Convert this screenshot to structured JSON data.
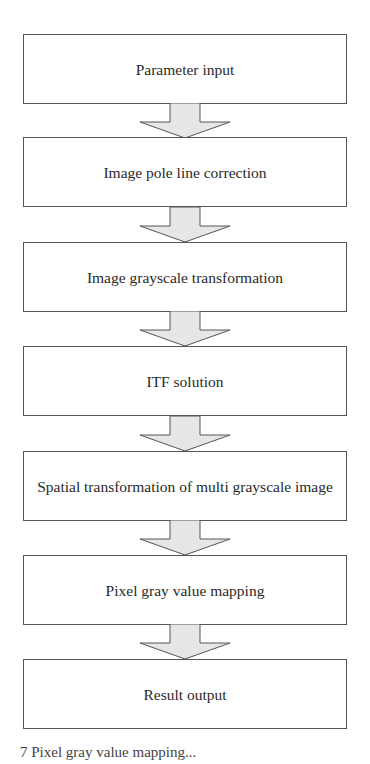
{
  "diagram": {
    "type": "flowchart",
    "direction": "top-to-bottom",
    "steps": [
      {
        "label": "Parameter input"
      },
      {
        "label": "Image pole line correction"
      },
      {
        "label": "Image grayscale transformation"
      },
      {
        "label": "ITF solution"
      },
      {
        "label": "Spatial transformation of multi grayscale image"
      },
      {
        "label": "Pixel gray value mapping"
      },
      {
        "label": "Result output"
      }
    ],
    "connector": "down-arrow-icon",
    "colors": {
      "box_border": "#555555",
      "arrow_fill": "#e6e6e6",
      "arrow_stroke": "#555555",
      "text": "#2a2a2a"
    }
  },
  "caption": {
    "text": "7  Pixel gray value mapping..."
  }
}
